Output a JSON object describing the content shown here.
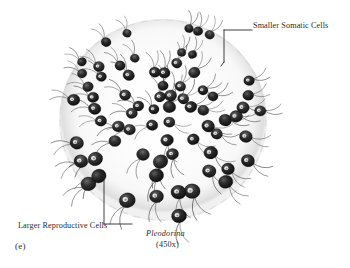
{
  "figure": {
    "panel_id": "(e)",
    "organism": "Pleodorina",
    "magnification": "(450x)",
    "labels": {
      "somatic": "Smaller Somatic Cells",
      "reproductive": "Larger Reproductive Cells"
    },
    "colors": {
      "background": "#ffffff",
      "ink": "#1a1a1a",
      "cell_dark": "#181818",
      "cell_mid": "#3a3a3a",
      "envelope": "#e9e9e9",
      "leader_line": "#2b2b2b",
      "text": "#2b2b2b"
    },
    "colony": {
      "center_x": 163,
      "center_y": 120,
      "radius": 104,
      "cell_count": 72,
      "somatic_region": "upper and peripheral",
      "reproductive_region": "lower and central-left"
    },
    "leaders": {
      "somatic_bracket": {
        "x": 224,
        "y_top": 30,
        "y_bottom": 62,
        "line_to_x": 252,
        "line_y": 30
      },
      "reproductive_bracket": {
        "x": 104,
        "y_top": 176,
        "y_bottom": 224,
        "line_to_x": 132,
        "line_y": 224
      }
    }
  }
}
